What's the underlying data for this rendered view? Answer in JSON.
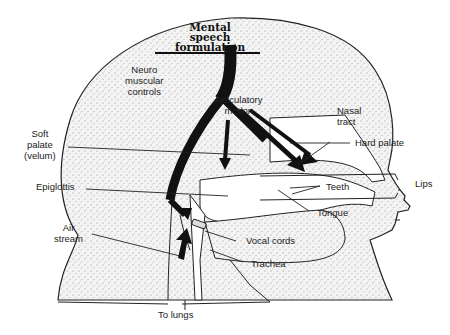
{
  "diagram": {
    "title_lines": [
      "Mental",
      "speech",
      "formulation"
    ],
    "labels": {
      "neuro": [
        "Neuro",
        "muscular",
        "controls"
      ],
      "articulatory": [
        "Articulatory",
        "motion"
      ],
      "nasal": [
        "Nasal",
        "tract"
      ],
      "hard_palate": "Hard palate",
      "soft_palate": [
        "Soft",
        "palate",
        "(velum)"
      ],
      "epiglottis": "Epiglottis",
      "teeth": "Teeth",
      "lips": "Lips",
      "tongue": "Tongue",
      "air_stream": [
        "Air",
        "stream"
      ],
      "vocal_cords": "Vocal cords",
      "trachea": "Trachea",
      "to_lungs": "To lungs"
    }
  }
}
